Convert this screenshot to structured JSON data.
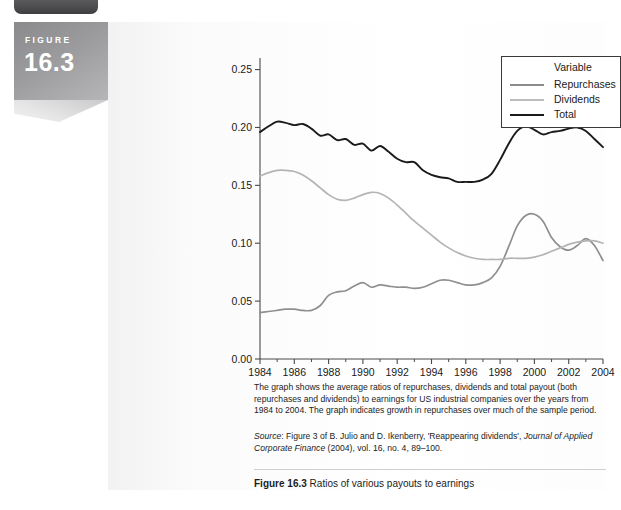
{
  "badge": {
    "label": "FIGURE",
    "number": "16.3"
  },
  "legend": {
    "title": "Variable",
    "items": [
      {
        "label": "Repurchases",
        "color": "#8c8c8c"
      },
      {
        "label": "Dividends",
        "color": "#bdbdbd"
      },
      {
        "label": "Total",
        "color": "#1a1a1a"
      }
    ]
  },
  "caption": {
    "body": "The graph shows the average ratios of repurchases, dividends and total payout (both repurchases and dividends) to earnings for US industrial companies over the years from 1984 to 2004. The graph indicates growth in repurchases over much of the sample period.",
    "source_label": "Source",
    "source_text": ": Figure 3 of B. Julio and D. Ikenberry, 'Reappearing dividends', ",
    "source_journal": "Journal of Applied Corporate Finance",
    "source_tail": " (2004), vol. 16, no. 4, 89–100.",
    "figure_label": "Figure 16.3",
    "figure_title": "Ratios of various payouts to earnings"
  },
  "chart_data": {
    "type": "line",
    "title": "",
    "xlabel": "",
    "ylabel": "",
    "xlim": [
      1984,
      2004
    ],
    "ylim": [
      0.0,
      0.26
    ],
    "yticks": [
      0.0,
      0.05,
      0.1,
      0.15,
      0.2,
      0.25
    ],
    "ytick_labels": [
      "0.00",
      "0.05",
      "0.10",
      "0.15",
      "0.20",
      "0.25"
    ],
    "xticks": [
      1984,
      1986,
      1988,
      1990,
      1992,
      1994,
      1996,
      1998,
      2000,
      2002,
      2004
    ],
    "xtick_labels": [
      "1984",
      "1986",
      "1988",
      "1990",
      "1992",
      "1994",
      "1996",
      "1998",
      "2000",
      "2002",
      "2004"
    ],
    "x_minor_ticks": [
      1985,
      1987,
      1989,
      1991,
      1993,
      1995,
      1997,
      1999,
      2001,
      2003
    ],
    "grid": false,
    "legend_position": "top-right",
    "x": [
      1984,
      1984.5,
      1985,
      1985.5,
      1986,
      1986.5,
      1987,
      1987.5,
      1988,
      1988.5,
      1989,
      1989.5,
      1990,
      1990.5,
      1991,
      1991.5,
      1992,
      1992.5,
      1993,
      1993.5,
      1994,
      1994.5,
      1995,
      1995.5,
      1996,
      1996.5,
      1997,
      1997.5,
      1998,
      1998.5,
      1999,
      1999.5,
      2000,
      2000.5,
      2001,
      2001.5,
      2002,
      2002.5,
      2003,
      2003.5,
      2004
    ],
    "series": [
      {
        "name": "Total",
        "color": "#1a1a1a",
        "width": 1.9,
        "values": [
          0.196,
          0.201,
          0.205,
          0.204,
          0.202,
          0.203,
          0.199,
          0.193,
          0.194,
          0.189,
          0.19,
          0.185,
          0.186,
          0.18,
          0.184,
          0.179,
          0.173,
          0.17,
          0.17,
          0.163,
          0.159,
          0.157,
          0.156,
          0.153,
          0.153,
          0.153,
          0.155,
          0.16,
          0.172,
          0.186,
          0.197,
          0.201,
          0.198,
          0.194,
          0.196,
          0.197,
          0.199,
          0.2,
          0.197,
          0.19,
          0.183
        ]
      },
      {
        "name": "Dividends",
        "color": "#b4b4b4",
        "width": 1.7,
        "values": [
          0.158,
          0.161,
          0.163,
          0.163,
          0.162,
          0.159,
          0.154,
          0.148,
          0.142,
          0.138,
          0.137,
          0.139,
          0.142,
          0.144,
          0.143,
          0.139,
          0.133,
          0.126,
          0.119,
          0.113,
          0.107,
          0.101,
          0.096,
          0.092,
          0.089,
          0.087,
          0.086,
          0.086,
          0.086,
          0.087,
          0.087,
          0.087,
          0.088,
          0.09,
          0.093,
          0.096,
          0.099,
          0.101,
          0.102,
          0.102,
          0.1
        ]
      },
      {
        "name": "Repurchases",
        "color": "#8f8f8f",
        "width": 1.7,
        "values": [
          0.04,
          0.041,
          0.042,
          0.043,
          0.043,
          0.042,
          0.042,
          0.046,
          0.055,
          0.058,
          0.059,
          0.063,
          0.066,
          0.062,
          0.064,
          0.063,
          0.062,
          0.062,
          0.061,
          0.062,
          0.065,
          0.068,
          0.068,
          0.066,
          0.064,
          0.064,
          0.066,
          0.07,
          0.08,
          0.097,
          0.115,
          0.124,
          0.125,
          0.119,
          0.105,
          0.097,
          0.094,
          0.098,
          0.104,
          0.098,
          0.085
        ]
      }
    ]
  }
}
